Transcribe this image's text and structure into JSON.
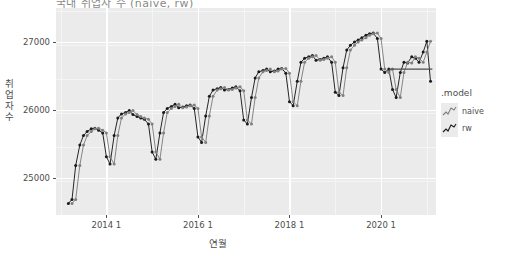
{
  "chart_data": {
    "type": "line",
    "title": "국내 취업자 수 (naive, rw)",
    "xlabel": "연월",
    "ylabel": "취업자수",
    "ylim": [
      24450,
      27500
    ],
    "xlim": [
      2012.9,
      2021.2
    ],
    "yticks": [
      25000,
      26000,
      27000
    ],
    "ytick_labels": [
      "25000",
      "26000",
      "27000"
    ],
    "xticks": [
      2014.0,
      2016.0,
      2018.0,
      2020.0
    ],
    "xtick_labels": [
      "2014 1",
      "2016 1",
      "2018 1",
      "2020 1"
    ],
    "grid": true,
    "legend": {
      "title": ".model",
      "position": "right",
      "entries": [
        {
          "name": "naive",
          "color": "#808080"
        },
        {
          "name": "rw",
          "color": "#1a1a1a"
        }
      ]
    },
    "series": [
      {
        "name": "rw",
        "color": "#1a1a1a",
        "x": [
          2013.17,
          2013.25,
          2013.33,
          2013.42,
          2013.5,
          2013.58,
          2013.67,
          2013.75,
          2013.83,
          2013.92,
          2014.0,
          2014.08,
          2014.17,
          2014.25,
          2014.33,
          2014.42,
          2014.5,
          2014.58,
          2014.67,
          2014.75,
          2014.83,
          2014.92,
          2015.0,
          2015.08,
          2015.17,
          2015.25,
          2015.33,
          2015.42,
          2015.5,
          2015.58,
          2015.67,
          2015.75,
          2015.83,
          2015.92,
          2016.0,
          2016.08,
          2016.17,
          2016.25,
          2016.33,
          2016.42,
          2016.5,
          2016.58,
          2016.67,
          2016.75,
          2016.83,
          2016.92,
          2017.0,
          2017.08,
          2017.17,
          2017.25,
          2017.33,
          2017.42,
          2017.5,
          2017.58,
          2017.67,
          2017.75,
          2017.83,
          2017.92,
          2018.0,
          2018.08,
          2018.17,
          2018.25,
          2018.33,
          2018.42,
          2018.5,
          2018.58,
          2018.67,
          2018.75,
          2018.83,
          2018.92,
          2019.0,
          2019.08,
          2019.17,
          2019.25,
          2019.33,
          2019.42,
          2019.5,
          2019.58,
          2019.67,
          2019.75,
          2019.83,
          2019.92,
          2020.0,
          2020.08,
          2020.17,
          2020.25,
          2020.33,
          2020.42,
          2020.5,
          2020.58,
          2020.67,
          2020.75,
          2020.83,
          2020.92,
          2021.0,
          2021.08
        ],
        "values": [
          24620,
          24680,
          25180,
          25480,
          25620,
          25680,
          25720,
          25730,
          25700,
          25660,
          25310,
          25200,
          25620,
          25880,
          25940,
          25960,
          25990,
          25930,
          25900,
          25880,
          25860,
          25790,
          25380,
          25270,
          25660,
          25960,
          26020,
          26050,
          26080,
          26030,
          26040,
          26060,
          26070,
          26020,
          25600,
          25520,
          25910,
          26200,
          26290,
          26310,
          26330,
          26290,
          26300,
          26320,
          26340,
          26280,
          25850,
          25790,
          26180,
          26470,
          26560,
          26580,
          26600,
          26560,
          26570,
          26600,
          26610,
          26540,
          26120,
          26060,
          26420,
          26700,
          26760,
          26780,
          26800,
          26730,
          26740,
          26760,
          26780,
          26700,
          26260,
          26210,
          26620,
          26880,
          26950,
          27000,
          27030,
          27060,
          27100,
          27120,
          27130,
          27050,
          26600,
          26550,
          26600,
          26300,
          26180,
          26550,
          26700,
          26690,
          26780,
          26760,
          26700,
          26850,
          27010,
          26420
        ]
      },
      {
        "name": "naive",
        "color": "#808080",
        "x": [
          2013.25,
          2013.33,
          2013.42,
          2013.5,
          2013.58,
          2013.67,
          2013.75,
          2013.83,
          2013.92,
          2014.0,
          2014.08,
          2014.17,
          2014.25,
          2014.33,
          2014.42,
          2014.5,
          2014.58,
          2014.67,
          2014.75,
          2014.83,
          2014.92,
          2015.0,
          2015.08,
          2015.17,
          2015.25,
          2015.33,
          2015.42,
          2015.5,
          2015.58,
          2015.67,
          2015.75,
          2015.83,
          2015.92,
          2016.0,
          2016.08,
          2016.17,
          2016.25,
          2016.33,
          2016.42,
          2016.5,
          2016.58,
          2016.67,
          2016.75,
          2016.83,
          2016.92,
          2017.0,
          2017.08,
          2017.17,
          2017.25,
          2017.33,
          2017.42,
          2017.5,
          2017.58,
          2017.67,
          2017.75,
          2017.83,
          2017.92,
          2018.0,
          2018.08,
          2018.17,
          2018.25,
          2018.33,
          2018.42,
          2018.5,
          2018.58,
          2018.67,
          2018.75,
          2018.83,
          2018.92,
          2019.0,
          2019.08,
          2019.17,
          2019.25,
          2019.33,
          2019.42,
          2019.5,
          2019.58,
          2019.67,
          2019.75,
          2019.83,
          2019.92,
          2020.0,
          2020.08,
          2020.17,
          2020.25,
          2020.33,
          2020.42,
          2020.5,
          2020.58,
          2020.67,
          2020.75,
          2020.83,
          2020.92,
          2021.0,
          2021.08
        ],
        "values": [
          24620,
          24680,
          25180,
          25480,
          25620,
          25680,
          25720,
          25730,
          25700,
          25660,
          25310,
          25200,
          25620,
          25880,
          25940,
          25960,
          25990,
          25930,
          25900,
          25880,
          25860,
          25790,
          25380,
          25270,
          25660,
          25960,
          26020,
          26050,
          26080,
          26030,
          26040,
          26060,
          26070,
          26020,
          25600,
          25520,
          25910,
          26200,
          26290,
          26310,
          26330,
          26290,
          26300,
          26320,
          26340,
          26280,
          25850,
          25790,
          26180,
          26470,
          26560,
          26580,
          26600,
          26560,
          26570,
          26600,
          26610,
          26540,
          26120,
          26060,
          26420,
          26700,
          26760,
          26780,
          26800,
          26730,
          26740,
          26760,
          26780,
          26700,
          26260,
          26210,
          26620,
          26880,
          26950,
          27000,
          27030,
          27060,
          27100,
          27120,
          27130,
          27050,
          26600,
          26550,
          26600,
          26300,
          26180,
          26550,
          26700,
          26690,
          26780,
          26760,
          26700,
          26850,
          27010
        ]
      },
      {
        "name": "forecast-flat",
        "color": "#4d4d4d",
        "x": [
          2020.17,
          2021.12
        ],
        "values": [
          26600,
          26600
        ]
      }
    ]
  }
}
